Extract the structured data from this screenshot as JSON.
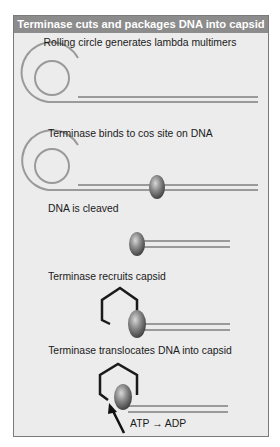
{
  "figure": {
    "title": "Terminase cuts and packages DNA into capsid",
    "steps": [
      {
        "label": "Rolling circle generates lambda multimers"
      },
      {
        "label": "Terminase binds to cos site on DNA"
      },
      {
        "label": "DNA is cleaved"
      },
      {
        "label": "Terminase recruits capsid"
      },
      {
        "label": "Terminase translocates DNA into capsid"
      }
    ],
    "annotation": "ATP → ADP"
  },
  "colors": {
    "header_bg": "#8c8c8c",
    "panel_bg": "#ececec",
    "dna_strand": "#9a9a9a",
    "terminase": "#6f6f6f",
    "capsid": "#1a1a1a"
  }
}
